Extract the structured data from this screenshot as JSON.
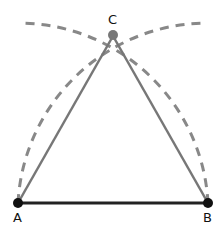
{
  "diagram": {
    "points": [
      {
        "label": "A",
        "x": 18,
        "y": 203
      },
      {
        "label": "B",
        "x": 208,
        "y": 203
      },
      {
        "label": "C",
        "x": 113,
        "y": 38
      }
    ],
    "colors": {
      "base": "#222222",
      "sides": "#777777",
      "arcs": "#888888",
      "point_dark": "#111111",
      "point_c": "#777777"
    }
  }
}
